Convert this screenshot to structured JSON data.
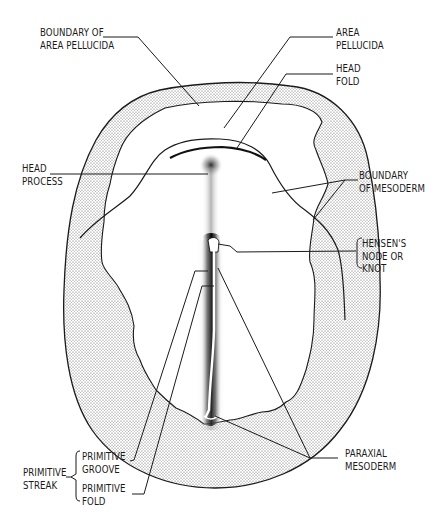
{
  "diagram": {
    "colors": {
      "ink": "#1a1a1a",
      "stipple": "#555555",
      "background": "#ffffff"
    },
    "labels": {
      "boundary_area_pellucida": {
        "line1": "BOUNDARY OF",
        "line2": "AREA PELLUCIDA"
      },
      "area_pellucida": {
        "line1": "AREA",
        "line2": "PELLUCIDA"
      },
      "head_fold": {
        "line1": "HEAD",
        "line2": "FOLD"
      },
      "head_process": {
        "line1": "HEAD",
        "line2": "PROCESS"
      },
      "boundary_mesoderm": {
        "line1": "BOUNDARY",
        "line2": "OF MESODERM"
      },
      "hensens_node": {
        "line1": "HENSEN'S",
        "line2": "NODE OR",
        "line3": "KNOT"
      },
      "paraxial_mesoderm": {
        "line1": "PARAXIAL",
        "line2": "MESODERM"
      },
      "primitive_streak": {
        "line1": "PRIMITIVE",
        "line2": "STREAK"
      },
      "primitive_groove": {
        "line1": "PRIMITIVE",
        "line2": "GROOVE"
      },
      "primitive_fold": {
        "line1": "PRIMITIVE",
        "line2": "FOLD"
      }
    }
  }
}
